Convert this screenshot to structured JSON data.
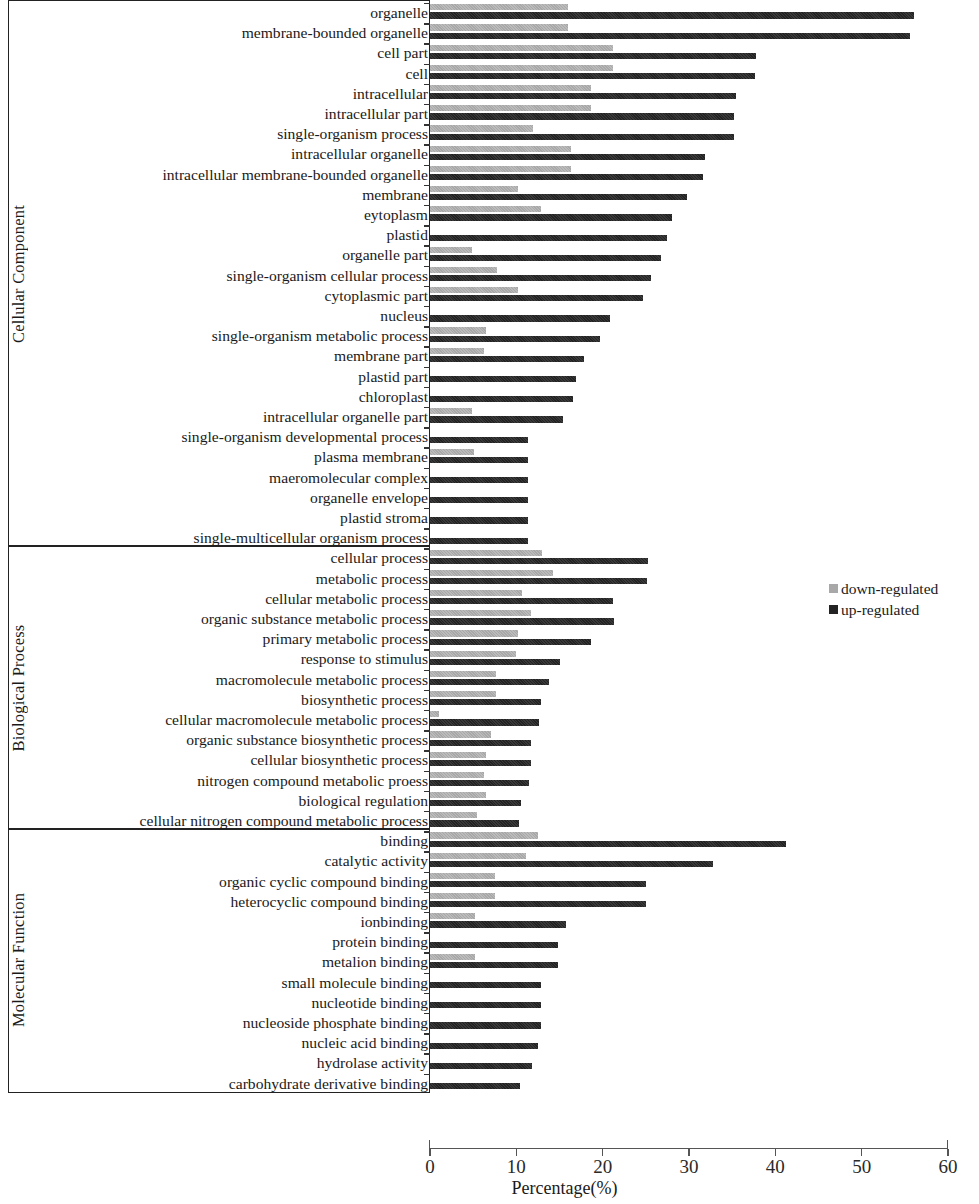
{
  "chart_data": {
    "type": "bar",
    "orientation": "horizontal",
    "title": "",
    "xlabel": "Percentage(%)",
    "ylabel": "",
    "xlim": [
      0,
      60
    ],
    "xticks": [
      0,
      10,
      20,
      30,
      40,
      50,
      60
    ],
    "grid": false,
    "legend_position": "right-middle",
    "series": [
      {
        "name": "down-regulated",
        "color": "#a8a8a8"
      },
      {
        "name": "up-regulated",
        "color": "#232323"
      }
    ],
    "groups": [
      {
        "name": "Cellular Component",
        "categories": [
          "organelle",
          "membrane-bounded organelle",
          "cell part",
          "cell",
          "intracellular",
          "intracellular part",
          "single-organism process",
          "intracellular organelle",
          "intracellular membrane-bounded organelle",
          "membrane",
          "eytoplasm",
          "plastid",
          "organelle part",
          "single-organism cellular process",
          "cytoplasmic part",
          "nucleus",
          "single-organism metabolic process",
          "membrane part",
          "plastid part",
          "chloroplast",
          "intracellular organelle part",
          "single-organism developmental process",
          "plasma membrane",
          "maeromolecular complex",
          "organelle envelope",
          "plastid stroma",
          "single-multicellular organism process"
        ],
        "down_regulated": [
          16.0,
          16.0,
          21.2,
          21.2,
          18.6,
          18.6,
          11.9,
          16.3,
          16.3,
          10.2,
          12.8,
          0.0,
          4.9,
          7.8,
          10.2,
          0.0,
          6.5,
          6.3,
          0.0,
          0.0,
          4.9,
          0.0,
          5.1,
          0.0,
          0.0,
          0.0,
          0.0
        ],
        "up_regulated": [
          56.1,
          55.6,
          37.8,
          37.6,
          35.4,
          35.2,
          35.2,
          31.8,
          31.6,
          29.8,
          28.0,
          27.4,
          26.8,
          25.6,
          24.7,
          20.9,
          19.7,
          17.8,
          16.9,
          16.6,
          15.4,
          11.4,
          11.3,
          11.3,
          11.3,
          11.3,
          11.3
        ]
      },
      {
        "name": "Biological Process",
        "categories": [
          "cellular process",
          "metabolic process",
          "cellular metabolic process",
          "organic substance metabolic process",
          "primary metabolic process",
          "response to stimulus",
          "macromolecule metabolic process",
          "biosynthetic process",
          "cellular macromolecule metabolic process",
          "organic substance biosynthetic process",
          "cellular biosynthetic process",
          "nitrogen compound metabolic proess",
          "biological regulation",
          "cellular nitrogen compound metabolic process"
        ],
        "down_regulated": [
          13.0,
          14.2,
          10.6,
          11.7,
          10.2,
          10.0,
          7.6,
          7.6,
          1.0,
          7.1,
          6.5,
          6.2,
          6.5,
          5.4
        ],
        "up_regulated": [
          25.3,
          25.1,
          21.2,
          21.3,
          18.7,
          15.0,
          13.8,
          12.9,
          12.6,
          11.7,
          11.7,
          11.5,
          10.5,
          10.3
        ]
      },
      {
        "name": "Molecular Function",
        "categories": [
          "binding",
          "catalytic activity",
          "organic cyclic compound binding",
          "heterocyclic compound binding",
          "ionbinding",
          "protein binding",
          "metalion binding",
          "small molecule binding",
          "nucleotide binding",
          "nucleoside phosphate binding",
          "nucleic acid binding",
          "hydrolase activity",
          "carbohydrate derivative binding"
        ],
        "down_regulated": [
          12.5,
          11.1,
          7.5,
          7.5,
          5.2,
          0.0,
          5.2,
          0.0,
          0.0,
          0.0,
          0.0,
          0.0,
          0.0
        ],
        "up_regulated": [
          41.2,
          32.8,
          25.0,
          25.0,
          15.7,
          14.8,
          14.8,
          12.9,
          12.9,
          12.9,
          12.5,
          11.8,
          10.4
        ]
      }
    ]
  },
  "legend": {
    "items": [
      {
        "label": "down-regulated"
      },
      {
        "label": "up-regulated"
      }
    ]
  },
  "axis": {
    "x_title": "Percentage(%)",
    "x_tick_labels": [
      "0",
      "10",
      "20",
      "30",
      "40",
      "50",
      "60"
    ]
  }
}
